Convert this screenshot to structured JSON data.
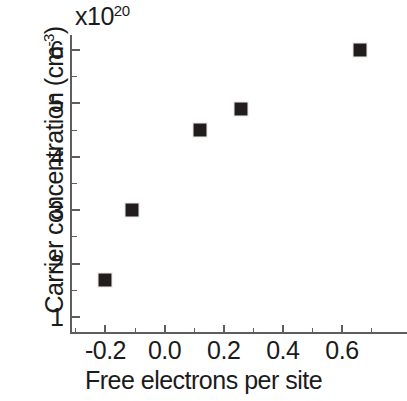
{
  "chart_data": {
    "type": "scatter",
    "title": "",
    "multiplier_label": "x10",
    "multiplier_exponent": "20",
    "xlabel": "Free electrons per site",
    "ylabel_main": "Carrier concentration (cm",
    "ylabel_exponent": "-3",
    "ylabel_close": ")",
    "ylabel_full": "Carrier concentration (cm^-3)",
    "x": [
      -0.2,
      -0.11,
      0.12,
      0.26,
      0.66
    ],
    "y": [
      1.7,
      3.0,
      4.5,
      4.9,
      6.0
    ],
    "y_units": "10^20 cm^-3",
    "xlim": [
      -0.32,
      0.82
    ],
    "ylim": [
      0.72,
      6.28
    ],
    "xticks": [
      -0.2,
      0.0,
      0.2,
      0.4,
      0.6
    ],
    "xticklabels": [
      "-0.2",
      "0.0",
      "0.2",
      "0.4",
      "0.6"
    ],
    "xminorticks": [
      -0.3,
      -0.1,
      0.1,
      0.3,
      0.5,
      0.7
    ],
    "yticks": [
      1,
      2,
      3,
      4,
      5,
      6
    ],
    "yticklabels": [
      "1",
      "2",
      "3",
      "4",
      "5",
      "6"
    ],
    "yminorticks": [
      1.5,
      2.5,
      3.5,
      4.5,
      5.5
    ],
    "grid": false,
    "legend": null,
    "marker": "filled-square",
    "marker_color": "#211d1d",
    "axis_color": "#5e5e5e",
    "text_color": "#1b1b1b",
    "background": "#ffffff",
    "series": [
      {
        "name": "carrier concentration",
        "points": [
          {
            "x": -0.2,
            "y": 1.7
          },
          {
            "x": -0.11,
            "y": 3.0
          },
          {
            "x": 0.12,
            "y": 4.5
          },
          {
            "x": 0.26,
            "y": 4.9
          },
          {
            "x": 0.66,
            "y": 6.0
          }
        ]
      }
    ]
  }
}
